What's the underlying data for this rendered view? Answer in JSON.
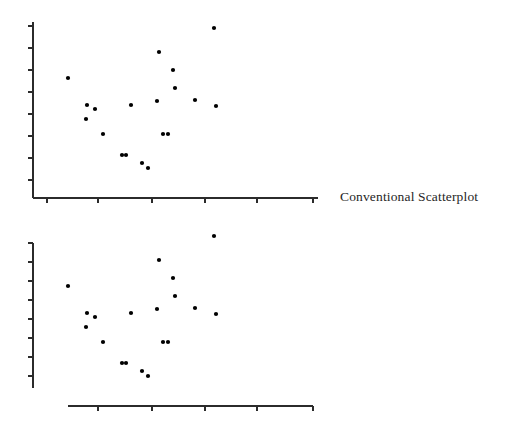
{
  "figure": {
    "title": "",
    "background": "#ffffff",
    "ink_color": "#1a1a1a",
    "axis_color": "#2b2b2b",
    "point_color": "#000000",
    "point_radius": 2.1
  },
  "panels": [
    {
      "id": "conventional",
      "label": "Conventional Scatterplot",
      "axis_style": "full-frame",
      "x_axis": {
        "x_start": 33,
        "x_end": 318,
        "y": 198,
        "ticks": [
          47,
          98,
          152,
          205,
          257,
          313
        ],
        "tick_length": 5
      },
      "y_axis": {
        "x": 33,
        "y_start": 22,
        "y_end": 198,
        "ticks": [
          26,
          48,
          70,
          92,
          114,
          136,
          158,
          180
        ],
        "tick_length": 5
      }
    },
    {
      "id": "rangeframe",
      "label": "Range-Frame",
      "axis_style": "range-frame",
      "x_axis": {
        "x_start": 68,
        "x_end": 313,
        "y": 406,
        "ticks": [
          98,
          152,
          205,
          257,
          313
        ],
        "tick_length": 5
      },
      "y_axis": {
        "x": 33,
        "y_start": 243,
        "y_end": 388,
        "ticks": [
          243,
          262,
          281,
          300,
          319,
          338,
          357,
          376
        ],
        "tick_length": 5
      }
    }
  ],
  "chart_data": {
    "type": "scatter",
    "title": "",
    "subtitle": "",
    "xlabel": "",
    "ylabel": "",
    "grid": false,
    "legend": false,
    "legend_position": "none",
    "n_points": 19,
    "xlim": [
      0,
      1
    ],
    "ylim": [
      0,
      1
    ],
    "series": [
      {
        "name": "observations",
        "color": "#000000",
        "marker": "filled-circle",
        "points": [
          {
            "x": 0.055,
            "y": 0.601
          },
          {
            "x": 0.117,
            "y": 0.466
          },
          {
            "x": 0.113,
            "y": 0.398
          },
          {
            "x": 0.141,
            "y": 0.444
          },
          {
            "x": 0.167,
            "y": 0.318
          },
          {
            "x": 0.23,
            "y": 0.205
          },
          {
            "x": 0.243,
            "y": 0.205
          },
          {
            "x": 0.297,
            "y": 0.165
          },
          {
            "x": 0.317,
            "y": 0.142
          },
          {
            "x": 0.262,
            "y": 0.466
          },
          {
            "x": 0.349,
            "y": 0.483
          },
          {
            "x": 0.357,
            "y": 0.812
          },
          {
            "x": 0.369,
            "y": 0.318
          },
          {
            "x": 0.386,
            "y": 0.318
          },
          {
            "x": 0.402,
            "y": 0.716
          },
          {
            "x": 0.476,
            "y": 0.489
          },
          {
            "x": 0.539,
            "y": 0.92
          },
          {
            "x": 0.545,
            "y": 0.443
          },
          {
            "x": 0.404,
            "y": 0.625
          }
        ]
      }
    ],
    "pixel_points_top": [
      [
        68,
        78
      ],
      [
        87,
        105
      ],
      [
        86,
        119
      ],
      [
        95,
        109
      ],
      [
        103,
        134
      ],
      [
        122,
        155
      ],
      [
        126,
        155
      ],
      [
        142,
        163
      ],
      [
        148,
        168
      ],
      [
        131,
        105
      ],
      [
        157,
        101
      ],
      [
        159,
        52
      ],
      [
        163,
        134
      ],
      [
        168,
        134
      ],
      [
        173,
        70
      ],
      [
        195,
        100
      ],
      [
        214,
        28
      ],
      [
        216,
        106
      ],
      [
        175,
        88
      ]
    ],
    "pixel_offset_bottom_y": 208
  }
}
